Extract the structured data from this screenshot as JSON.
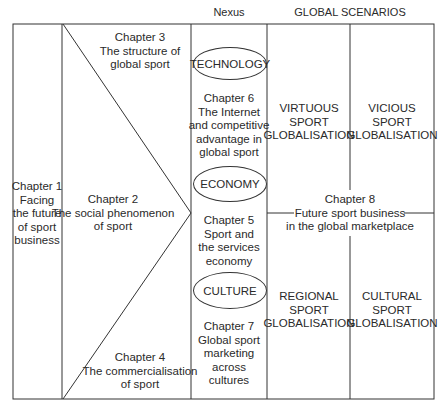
{
  "headers": {
    "nexus": "Nexus",
    "global_scenarios": "GLOBAL SCENARIOS"
  },
  "chapters": {
    "ch1": [
      "Chapter 1",
      "Facing",
      "the future",
      "of sport",
      "business"
    ],
    "ch2": [
      "Chapter 2",
      "The social phenomenon",
      "of sport"
    ],
    "ch3": [
      "Chapter 3",
      "The structure of",
      "global sport"
    ],
    "ch4": [
      "Chapter 4",
      "The commercialisation",
      "of sport"
    ],
    "ch5": [
      "Chapter 5",
      "Sport and",
      "the services",
      "economy"
    ],
    "ch6": [
      "Chapter 6",
      "The Internet",
      "and competitive",
      "advantage in",
      "global sport"
    ],
    "ch7": [
      "Chapter 7",
      "Global sport",
      "marketing",
      "across",
      "cultures"
    ],
    "ch8": [
      "Chapter 8",
      "Future sport business",
      "in the global marketplace"
    ]
  },
  "nexus": {
    "technology": "TECHNOLOGY",
    "economy": "ECONOMY",
    "culture": "CULTURE"
  },
  "scenarios": {
    "virtuous": [
      "VIRTUOUS",
      "SPORT",
      "GLOBALISATION"
    ],
    "vicious": [
      "VICIOUS",
      "SPORT",
      "GLOBALISATION"
    ],
    "regional": [
      "REGIONAL",
      "SPORT",
      "GLOBALISATION"
    ],
    "cultural": [
      "CULTURAL",
      "SPORT",
      "GLOBALISATION"
    ]
  }
}
